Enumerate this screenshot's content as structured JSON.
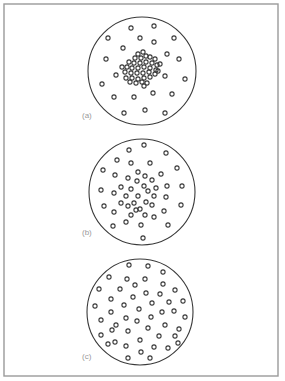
{
  "figure": {
    "frame": {
      "x": 4,
      "y": 4,
      "w": 274,
      "h": 372
    },
    "panels": [
      {
        "label": "(a)",
        "label_pos": [
          82,
          118
        ],
        "description": "dots clustered densely near center",
        "circle": {
          "cx": 142,
          "cy": 71,
          "r": 54
        },
        "dot_radius": 2.1,
        "dots": [
          [
            131,
            28
          ],
          [
            154,
            26
          ],
          [
            108,
            38
          ],
          [
            140,
            38
          ],
          [
            154,
            42
          ],
          [
            174,
            38
          ],
          [
            123,
            48
          ],
          [
            167,
            54
          ],
          [
            106,
            59
          ],
          [
            179,
            59
          ],
          [
            116,
            75
          ],
          [
            165,
            76
          ],
          [
            185,
            79
          ],
          [
            102,
            84
          ],
          [
            114,
            97
          ],
          [
            134,
            97
          ],
          [
            153,
            93
          ],
          [
            172,
            94
          ],
          [
            124,
            113
          ],
          [
            145,
            110
          ],
          [
            165,
            113
          ],
          [
            143,
            52
          ],
          [
            138,
            54
          ],
          [
            146,
            56
          ],
          [
            135,
            58
          ],
          [
            141,
            58
          ],
          [
            150,
            57
          ],
          [
            155,
            59
          ],
          [
            129,
            62
          ],
          [
            134,
            63
          ],
          [
            140,
            63
          ],
          [
            146,
            62
          ],
          [
            152,
            63
          ],
          [
            157,
            65
          ],
          [
            127,
            67
          ],
          [
            132,
            68
          ],
          [
            138,
            68
          ],
          [
            144,
            67
          ],
          [
            150,
            68
          ],
          [
            156,
            70
          ],
          [
            125,
            72
          ],
          [
            131,
            73
          ],
          [
            137,
            73
          ],
          [
            143,
            73
          ],
          [
            149,
            72
          ],
          [
            155,
            74
          ],
          [
            126,
            78
          ],
          [
            132,
            78
          ],
          [
            138,
            79
          ],
          [
            144,
            78
          ],
          [
            150,
            77
          ],
          [
            130,
            82
          ],
          [
            136,
            83
          ],
          [
            142,
            82
          ],
          [
            147,
            83
          ],
          [
            144,
            86
          ],
          [
            158,
            71
          ],
          [
            122,
            67
          ],
          [
            160,
            64
          ]
        ]
      },
      {
        "label": "(b)",
        "label_pos": [
          82,
          235
        ],
        "description": "dots moderately concentrated toward center",
        "circle": {
          "cx": 142,
          "cy": 192,
          "r": 53
        },
        "dot_radius": 2.1,
        "dots": [
          [
            144,
            145
          ],
          [
            129,
            150
          ],
          [
            166,
            153
          ],
          [
            117,
            160
          ],
          [
            131,
            163
          ],
          [
            150,
            163
          ],
          [
            177,
            168
          ],
          [
            103,
            170
          ],
          [
            115,
            175
          ],
          [
            161,
            174
          ],
          [
            101,
            190
          ],
          [
            114,
            193
          ],
          [
            182,
            186
          ],
          [
            104,
            206
          ],
          [
            114,
            212
          ],
          [
            181,
            205
          ],
          [
            113,
            226
          ],
          [
            126,
            222
          ],
          [
            141,
            225
          ],
          [
            154,
            217
          ],
          [
            168,
            225
          ],
          [
            143,
            238
          ],
          [
            164,
            211
          ],
          [
            138,
            172
          ],
          [
            145,
            176
          ],
          [
            128,
            178
          ],
          [
            137,
            181
          ],
          [
            152,
            180
          ],
          [
            121,
            187
          ],
          [
            144,
            186
          ],
          [
            156,
            188
          ],
          [
            131,
            189
          ],
          [
            148,
            191
          ],
          [
            167,
            186
          ],
          [
            126,
            196
          ],
          [
            138,
            196
          ],
          [
            154,
            196
          ],
          [
            134,
            203
          ],
          [
            146,
            202
          ],
          [
            140,
            209
          ],
          [
            152,
            205
          ],
          [
            128,
            206
          ],
          [
            166,
            197
          ],
          [
            136,
            210
          ],
          [
            145,
            215
          ],
          [
            121,
            203
          ],
          [
            131,
            215
          ]
        ]
      },
      {
        "label": "(c)",
        "label_pos": [
          82,
          359
        ],
        "description": "dots distributed uniformly",
        "circle": {
          "cx": 140,
          "cy": 312,
          "r": 53
        },
        "dot_radius": 2.1,
        "dots": [
          [
            129,
            265
          ],
          [
            148,
            266
          ],
          [
            163,
            272
          ],
          [
            109,
            277
          ],
          [
            127,
            279
          ],
          [
            145,
            279
          ],
          [
            163,
            284
          ],
          [
            99,
            289
          ],
          [
            120,
            289
          ],
          [
            135,
            285
          ],
          [
            175,
            290
          ],
          [
            146,
            293
          ],
          [
            111,
            299
          ],
          [
            133,
            297
          ],
          [
            160,
            294
          ],
          [
            95,
            306
          ],
          [
            124,
            305
          ],
          [
            152,
            303
          ],
          [
            169,
            302
          ],
          [
            183,
            301
          ],
          [
            111,
            312
          ],
          [
            139,
            309
          ],
          [
            162,
            312
          ],
          [
            174,
            311
          ],
          [
            101,
            320
          ],
          [
            126,
            318
          ],
          [
            151,
            317
          ],
          [
            185,
            317
          ],
          [
            137,
            321
          ],
          [
            165,
            325
          ],
          [
            112,
            330
          ],
          [
            128,
            331
          ],
          [
            148,
            328
          ],
          [
            179,
            329
          ],
          [
            101,
            335
          ],
          [
            159,
            336
          ],
          [
            175,
            336
          ],
          [
            115,
            342
          ],
          [
            126,
            346
          ],
          [
            140,
            340
          ],
          [
            154,
            347
          ],
          [
            168,
            348
          ],
          [
            128,
            358
          ],
          [
            141,
            352
          ],
          [
            150,
            358
          ],
          [
            116,
            325
          ],
          [
            108,
            344
          ],
          [
            178,
            343
          ]
        ]
      }
    ]
  }
}
